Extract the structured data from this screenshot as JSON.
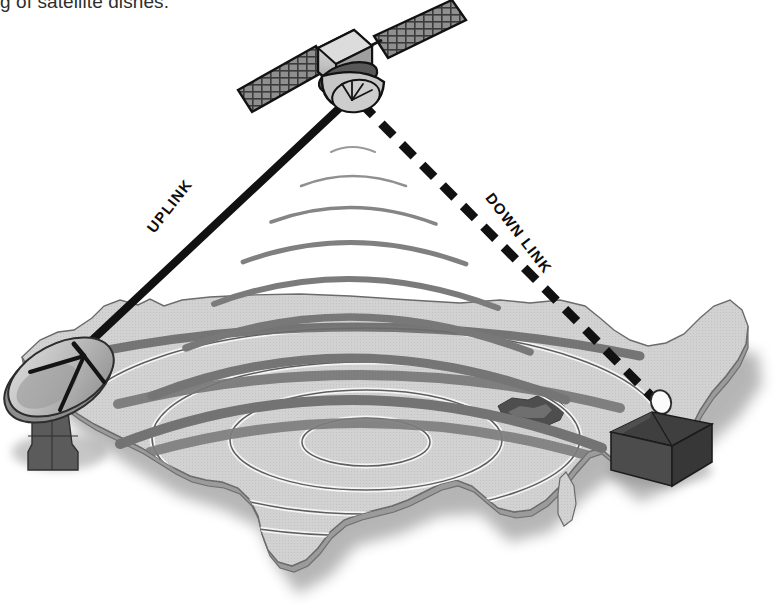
{
  "page": {
    "caption_partial": "g of satellite dishes.",
    "background_color": "#ffffff"
  },
  "diagram": {
    "name": "satellite-communication-diagram",
    "labels": {
      "uplink": "UPLINK",
      "downlink": "DOWN LINK"
    },
    "colors": {
      "uplink_line": "#111111",
      "downlink_line": "#111111",
      "beam_arc": "#7d7d7d",
      "map_fill": "#cfcfcf",
      "map_top_fill": "#d6d6d6",
      "map_edge": "#6e6e6e",
      "map_shadow": "#8d8d8d",
      "footprint_ring": "#5a5a5a",
      "footprint_highlight": "#f2f2f2",
      "satellite_body": "#c9c9c9",
      "satellite_panel": "#8a8a8a",
      "satellite_outline": "#141414",
      "ground_dish_face": "#b4b4b4",
      "ground_dish_rim": "#8e8e8e",
      "ground_dish_base": "#595959",
      "house_body": "#4a4a4a",
      "house_roof": "#3d3d3d",
      "house_dish": "#fbfbfb",
      "text": "#0d0d0d"
    },
    "elements": {
      "satellite": "communications-satellite",
      "ground_station": "ground-station-dish",
      "receiver": "house-with-dish",
      "map": "united-states-map",
      "beam": "broadcast-beam-arcs",
      "footprint": "coverage-footprint-rings"
    },
    "geometry": {
      "satellite_center": [
        352,
        88
      ],
      "beam_origin": [
        352,
        104
      ],
      "uplink_start": [
        56,
        372
      ],
      "uplink_end": [
        348,
        100
      ],
      "downlink_start": [
        360,
        104
      ],
      "downlink_end": [
        661,
        406
      ],
      "beam_arc_count": 8,
      "footprint_ring_count": 4
    }
  }
}
